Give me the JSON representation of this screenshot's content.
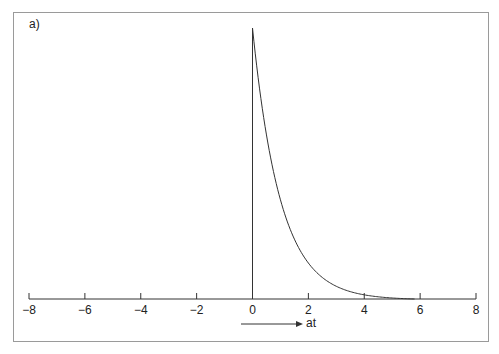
{
  "panel_label": "a)",
  "chart_data": {
    "type": "line",
    "title": "",
    "panel": "a)",
    "xlabel": "at",
    "xlabel_arrow": true,
    "ylabel": "",
    "xlim": [
      -8,
      8
    ],
    "ylim": [
      0,
      1
    ],
    "xticks": [
      -8,
      -6,
      -4,
      -2,
      0,
      2,
      4,
      6,
      8
    ],
    "xtick_labels": [
      "−8",
      "−6",
      "−4",
      "−2",
      "0",
      "2",
      "4",
      "6",
      "8"
    ],
    "grid": false,
    "legend": "none",
    "series": [
      {
        "name": "exponential decay",
        "description": "zero for at<0, jumps to peak 1 at at=0, decays as exp(-at)",
        "x": [
          0,
          0,
          0.25,
          0.5,
          0.75,
          1,
          1.5,
          2,
          2.5,
          3,
          3.5,
          4,
          4.5,
          5,
          5.5,
          5.8
        ],
        "y": [
          0,
          1,
          0.779,
          0.607,
          0.472,
          0.368,
          0.223,
          0.135,
          0.082,
          0.05,
          0.03,
          0.018,
          0.011,
          0.007,
          0.004,
          0.0
        ]
      }
    ]
  }
}
